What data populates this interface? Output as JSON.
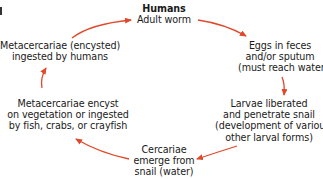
{
  "diagram": {
    "type": "life-cycle",
    "arrow_color": "#e0482a",
    "nodes": [
      {
        "id": "humans",
        "lines": [
          "Humans",
          "Adult worm"
        ],
        "title_bold": true
      },
      {
        "id": "eggs",
        "lines": [
          "Eggs in feces",
          "and/or sputum",
          "(must reach water)"
        ]
      },
      {
        "id": "larvae",
        "lines": [
          "Larvae liberated",
          "and penetrate snail",
          "(development of various",
          "other larval forms)"
        ]
      },
      {
        "id": "cercariae",
        "lines": [
          "Cercariae",
          "emerge from",
          "snail (water)"
        ]
      },
      {
        "id": "metacercariae-encyst",
        "lines": [
          "Metacercariae encyst",
          "on vegetation or ingested",
          "by fish, crabs, or crayfish"
        ]
      },
      {
        "id": "metacercariae-ingested",
        "lines": [
          "Metacercariae (encysted)",
          "ingested by humans"
        ]
      }
    ],
    "edges": [
      {
        "from": "humans",
        "to": "eggs"
      },
      {
        "from": "eggs",
        "to": "larvae"
      },
      {
        "from": "larvae",
        "to": "cercariae"
      },
      {
        "from": "cercariae",
        "to": "metacercariae-encyst"
      },
      {
        "from": "metacercariae-encyst",
        "to": "metacercariae-ingested"
      },
      {
        "from": "metacercariae-ingested",
        "to": "humans"
      }
    ]
  }
}
